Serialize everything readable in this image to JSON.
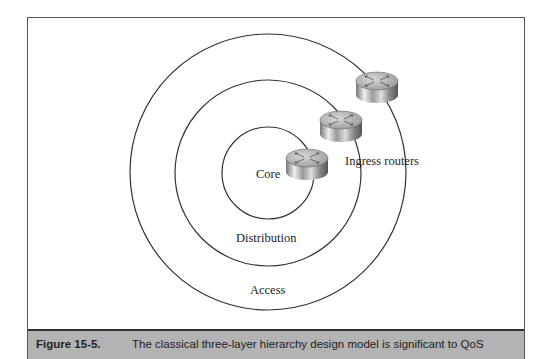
{
  "diagram": {
    "layers": [
      {
        "name": "Core",
        "cx": 268,
        "cy": 173,
        "r": 46
      },
      {
        "name": "Distribution",
        "cx": 268,
        "cy": 173,
        "r": 93
      },
      {
        "name": "Access",
        "cx": 268,
        "cy": 172,
        "r": 138
      }
    ],
    "labels": {
      "core": "Core",
      "distribution": "Distribution",
      "access": "Access",
      "ingress": "Ingress routers"
    },
    "routers": [
      {
        "x": 307,
        "y": 163
      },
      {
        "x": 341,
        "y": 125
      },
      {
        "x": 377,
        "y": 86
      }
    ]
  },
  "caption": {
    "number": "Figure 15-5.",
    "text": "The classical three-layer hierarchy design model is significant to QoS"
  }
}
